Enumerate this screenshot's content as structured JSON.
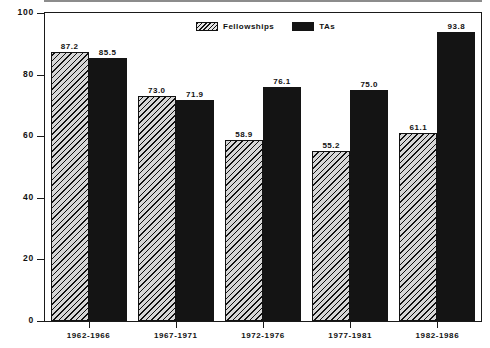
{
  "chart_data": {
    "type": "bar",
    "title": "",
    "xlabel": "",
    "ylabel": "Percent",
    "ylim": [
      0,
      100
    ],
    "yticks": [
      0,
      20,
      40,
      60,
      80,
      100
    ],
    "ytick_labels": [
      "0",
      "20",
      "40",
      "60",
      "80",
      "100"
    ],
    "grid": false,
    "legend_position": "top-center",
    "categories": [
      "1962-1966",
      "1967-1971",
      "1972-1976",
      "1977-1981",
      "1982-1986"
    ],
    "series": [
      {
        "name": "Fellowships",
        "color": "#d6d6d6",
        "pattern": "diagonal-hatch",
        "values": [
          87.2,
          73.0,
          58.9,
          55.2,
          61.1
        ],
        "value_labels": [
          "87.2",
          "73.0",
          "58.9",
          "55.2",
          "61.1"
        ]
      },
      {
        "name": "TAs",
        "color": "#141414",
        "pattern": "solid",
        "values": [
          85.5,
          71.9,
          76.1,
          75.0,
          93.8
        ],
        "value_labels": [
          "85.5",
          "71.9",
          "76.1",
          "75.0",
          "93.8"
        ]
      }
    ]
  },
  "axis": {
    "y_title": "Percent",
    "y_ticks": [
      {
        "label": "100",
        "value": 100
      },
      {
        "label": "80",
        "value": 80
      },
      {
        "label": "60",
        "value": 60
      },
      {
        "label": "40",
        "value": 40
      },
      {
        "label": "20",
        "value": 20
      },
      {
        "label": "0",
        "value": 0
      }
    ]
  },
  "legend": {
    "items": [
      {
        "label": "Fellowships",
        "swatch": "hatched-swatch"
      },
      {
        "label": "TAs",
        "swatch": "solid-black-swatch"
      }
    ]
  }
}
